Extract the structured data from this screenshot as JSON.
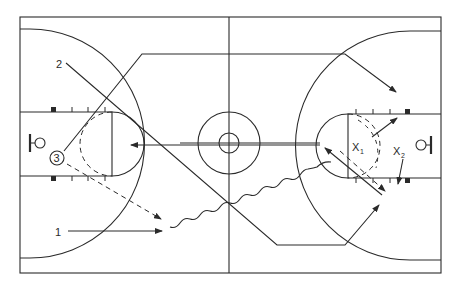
{
  "diagram": {
    "type": "basketball-play",
    "court": {
      "line_color": "#2a2a2a",
      "background": "#ffffff"
    },
    "offense": [
      {
        "id": "1",
        "label": "1",
        "action": "cut",
        "path": "solid-arrow"
      },
      {
        "id": "2",
        "label": "2",
        "action": "cut",
        "path": "solid-arrow"
      },
      {
        "id": "3",
        "label": "3",
        "action": "passer",
        "circled": true
      }
    ],
    "defense": [
      {
        "id": "x1",
        "label": "X",
        "sub": "1"
      },
      {
        "id": "x2",
        "label": "X",
        "sub": "2"
      }
    ],
    "actions": [
      {
        "type": "pass",
        "style": "dashed",
        "from": "3",
        "to": "1"
      },
      {
        "type": "dribble",
        "style": "wavy",
        "from": "1",
        "to": "right-elbow"
      },
      {
        "type": "pass",
        "style": "solid",
        "from": "right-elbow",
        "to": "left-paint"
      },
      {
        "type": "cut",
        "style": "solid",
        "from": "2",
        "to": "right-wing"
      },
      {
        "type": "defensive-move",
        "style": "solid",
        "from": "x1",
        "to": "right-block"
      },
      {
        "type": "defensive-move",
        "style": "solid",
        "from": "x2",
        "to": "right-low-block"
      }
    ]
  }
}
